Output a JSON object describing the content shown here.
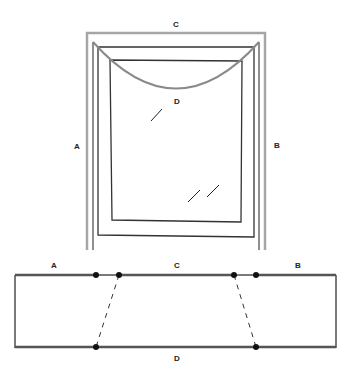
{
  "figure": {
    "top_view": {
      "labels": {
        "top": "C",
        "left": "A",
        "right": "B",
        "center": "D"
      }
    },
    "bottom_strip": {
      "labels": {
        "left": "A",
        "middle": "C",
        "right": "B",
        "bottom": "D"
      }
    },
    "colors": {
      "outer_frame": "#9a9a9a",
      "inner_frame": "#333333",
      "arc": "#8a8a8a",
      "strip_edge": "#444444",
      "dot": "#111111"
    }
  }
}
